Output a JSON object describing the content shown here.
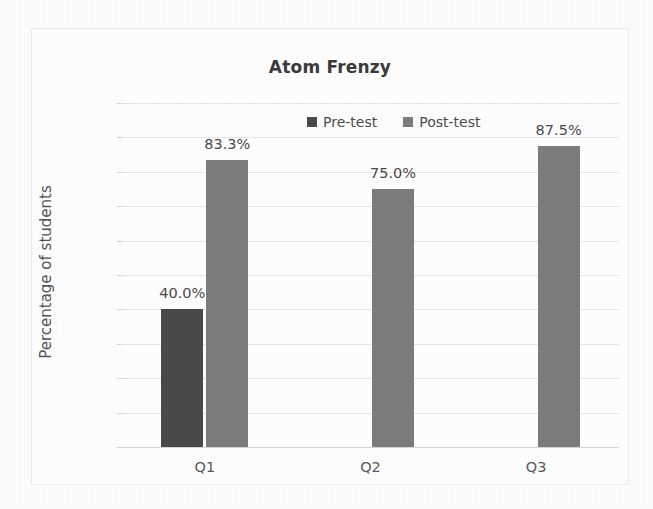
{
  "chart_data": {
    "type": "bar",
    "title": "Atom Frenzy",
    "xlabel": "",
    "ylabel": "Percentage of students",
    "categories": [
      "Q1",
      "Q2",
      "Q3"
    ],
    "series": [
      {
        "name": "Pre-test",
        "color": "#4a4a4a",
        "values": [
          40.0,
          null,
          null
        ],
        "labels": [
          "40.0%",
          "",
          ""
        ]
      },
      {
        "name": "Post-test",
        "color": "#7d7d7d",
        "values": [
          83.3,
          75.0,
          87.5
        ],
        "labels": [
          "83.3%",
          "75.0%",
          "87.5%"
        ]
      }
    ],
    "ylim": [
      0,
      100
    ],
    "ytick_values": [
      100,
      90,
      80,
      70,
      60,
      50,
      40,
      30,
      20,
      10,
      0
    ],
    "ytick_labels": [
      "100.0%",
      "90.0%",
      "80.0%",
      "70.0%",
      "60.0%",
      "50.0%",
      "40.0%",
      "30.0%",
      "20.0%",
      "10.0%",
      "0.0%"
    ],
    "grid": true,
    "legend_position": "top-center-inside",
    "data_labels": true
  },
  "legend": {
    "items": [
      {
        "label": "Pre-test",
        "color": "#4a4a4a",
        "swatch": "square-swatch"
      },
      {
        "label": "Post-test",
        "color": "#7d7d7d",
        "swatch": "square-swatch"
      }
    ]
  },
  "colors": {
    "pre_test": "#4a4a4a",
    "post_test": "#7d7d7d",
    "gridline": "#e8e8e8",
    "text": "#5a5a5a",
    "title": "#3b3b3b",
    "background": "#ffffff"
  }
}
